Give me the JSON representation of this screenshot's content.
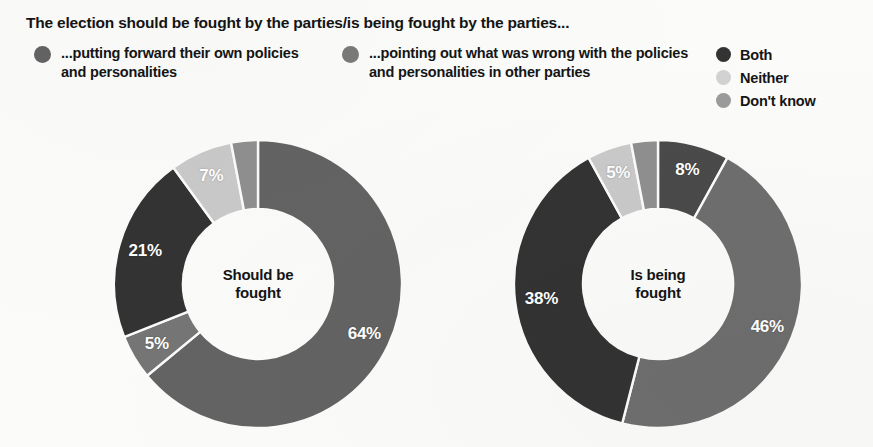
{
  "header": {
    "headline": "The election should be fought by the parties/is being fought by the parties..."
  },
  "legend": {
    "primary": [
      {
        "key": "own-policies",
        "label": "...putting forward their own policies and personalities",
        "color": "#636363"
      },
      {
        "key": "pointing-out",
        "label": "...pointing out what was wrong with the policies and personalities in other parties",
        "color": "#7a7a7a"
      }
    ],
    "secondary": [
      {
        "key": "both",
        "label": "Both",
        "color": "#333333"
      },
      {
        "key": "neither",
        "label": "Neither",
        "color": "#d2d2d2"
      },
      {
        "key": "dont-know",
        "label": "Don't know",
        "color": "#9b9b9b"
      }
    ]
  },
  "chart_data": [
    {
      "type": "pie",
      "id": "should-be-fought",
      "title": "Should be fought",
      "center_label_lines": [
        "Should be",
        "fought"
      ],
      "donut": true,
      "hole_ratio": 0.52,
      "start_angle_deg": 0,
      "direction": "clockwise",
      "categories": [
        "...putting forward their own policies and personalities",
        "Neither",
        "Both",
        "...pointing out what was wrong with the policies and personalities in other parties",
        "Don't know"
      ],
      "values": [
        64,
        5,
        21,
        7,
        3
      ],
      "labels": [
        "64%",
        "5%",
        "21%",
        "7%",
        ""
      ],
      "colors": [
        "#636363",
        "#d2d2d2",
        "#333333",
        "#d2d2d2",
        "#9b9b9b"
      ],
      "slices": [
        {
          "key": "own-policies",
          "label": "64%",
          "value": 64,
          "color": "#636363",
          "show_label": true
        },
        {
          "key": "pointing-out",
          "label": "5%",
          "value": 5,
          "color": "#757575",
          "show_label": true
        },
        {
          "key": "both",
          "label": "21%",
          "value": 21,
          "color": "#333333",
          "show_label": true
        },
        {
          "key": "neither",
          "label": "7%",
          "value": 7,
          "color": "#c9c9c9",
          "show_label": true
        },
        {
          "key": "dont-know",
          "label": "3%",
          "value": 3,
          "color": "#8f8f8f",
          "show_label": false
        }
      ]
    },
    {
      "type": "pie",
      "id": "is-being-fought",
      "title": "Is being fought",
      "center_label_lines": [
        "Is being",
        "fought"
      ],
      "donut": true,
      "hole_ratio": 0.52,
      "start_angle_deg": 0,
      "direction": "clockwise",
      "categories": [
        "Both",
        "...pointing out what was wrong with the policies and personalities in other parties",
        "...putting forward their own policies and personalities",
        "Neither",
        "Don't know"
      ],
      "values": [
        8,
        46,
        38,
        5,
        3
      ],
      "labels": [
        "8%",
        "46%",
        "38%",
        "5%",
        ""
      ],
      "colors": [
        "#4a4a4a",
        "#6e6e6e",
        "#333333",
        "#d2d2d2",
        "#9b9b9b"
      ],
      "slices": [
        {
          "key": "both",
          "label": "8%",
          "value": 8,
          "color": "#4a4a4a",
          "show_label": true
        },
        {
          "key": "pointing-out",
          "label": "46%",
          "value": 46,
          "color": "#6e6e6e",
          "show_label": true
        },
        {
          "key": "own-policies",
          "label": "38%",
          "value": 38,
          "color": "#333333",
          "show_label": true
        },
        {
          "key": "neither",
          "label": "5%",
          "value": 5,
          "color": "#c9c9c9",
          "show_label": true
        },
        {
          "key": "dont-know",
          "label": "3%",
          "value": 3,
          "color": "#8f8f8f",
          "show_label": false
        }
      ]
    }
  ]
}
